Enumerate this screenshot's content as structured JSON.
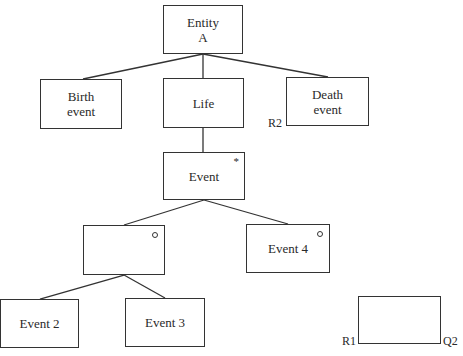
{
  "diagram": {
    "root": {
      "line1": "Entity",
      "line2": "A"
    },
    "level1": [
      {
        "line1": "Birth",
        "line2": "event"
      },
      {
        "line1": "Life"
      },
      {
        "line1": "Death",
        "line2": "event",
        "label": "R2"
      }
    ],
    "iteration": {
      "label": "Event",
      "marker": "*"
    },
    "selection": [
      {
        "label": "",
        "marker": "o"
      },
      {
        "label": "Event 4",
        "marker": "o"
      }
    ],
    "sequence": [
      {
        "label": "Event 2"
      },
      {
        "label": "Event 3"
      }
    ],
    "legend_box": {
      "left_label": "R1",
      "right_label": "Q2"
    }
  }
}
